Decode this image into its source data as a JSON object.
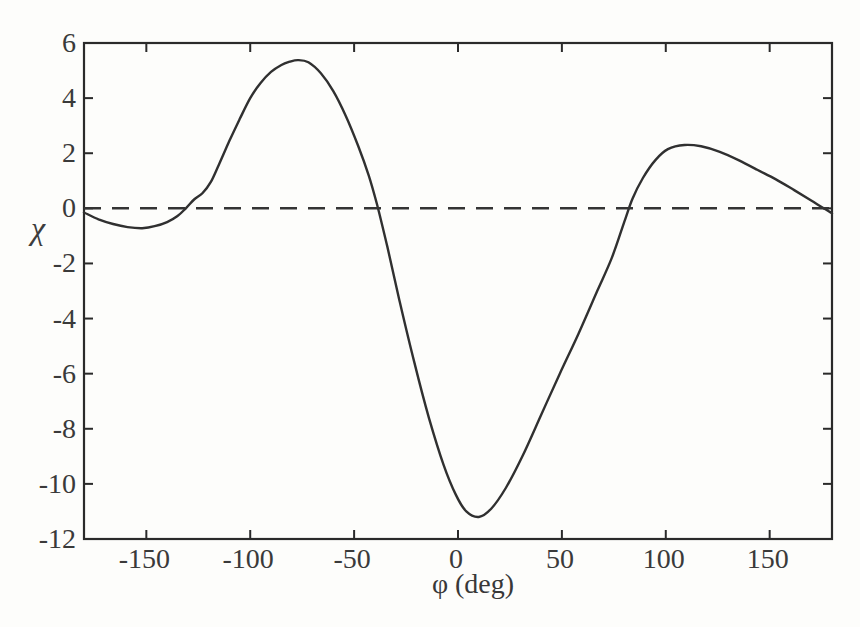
{
  "figure": {
    "background_color": "#fdfdfb",
    "curve_color": "#303030",
    "dash_color": "#343434",
    "axis_color": "#2a2a2a",
    "text_color": "#3a3a3a"
  },
  "chart_data": {
    "type": "line",
    "title": "",
    "xlabel": "φ (deg)",
    "ylabel": "χ",
    "xlim": [
      -180,
      180
    ],
    "ylim": [
      -12,
      6
    ],
    "x_ticks": [
      -150,
      -100,
      -50,
      0,
      50,
      100,
      150
    ],
    "x_tick_labels": [
      "-150",
      "-100",
      "-50",
      "0",
      "50",
      "100",
      "150"
    ],
    "y_ticks": [
      6,
      4,
      2,
      0,
      -2,
      -4,
      -6,
      -8,
      -10,
      -12
    ],
    "y_tick_labels": [
      "6",
      "4",
      "2",
      "0",
      "-2",
      "-4",
      "-6",
      "-8",
      "-10",
      "-12"
    ],
    "grid": false,
    "legend": null,
    "series": [
      {
        "name": "chi-vs-phi",
        "style": "solid",
        "points": [
          [
            -180,
            -0.15
          ],
          [
            -173,
            -0.4
          ],
          [
            -166,
            -0.57
          ],
          [
            -159,
            -0.68
          ],
          [
            -152,
            -0.72
          ],
          [
            -146,
            -0.65
          ],
          [
            -140,
            -0.5
          ],
          [
            -135,
            -0.28
          ],
          [
            -131,
            0.0
          ],
          [
            -127,
            0.32
          ],
          [
            -123,
            0.55
          ],
          [
            -119,
            0.95
          ],
          [
            -115,
            1.6
          ],
          [
            -110,
            2.45
          ],
          [
            -105,
            3.25
          ],
          [
            -100,
            4.0
          ],
          [
            -95,
            4.55
          ],
          [
            -90,
            4.95
          ],
          [
            -85,
            5.2
          ],
          [
            -81,
            5.32
          ],
          [
            -77,
            5.38
          ],
          [
            -72,
            5.3
          ],
          [
            -66,
            4.9
          ],
          [
            -60,
            4.25
          ],
          [
            -54,
            3.35
          ],
          [
            -48,
            2.25
          ],
          [
            -43,
            1.2
          ],
          [
            -39,
            0.15
          ],
          [
            -34,
            -1.4
          ],
          [
            -28,
            -3.4
          ],
          [
            -21,
            -5.6
          ],
          [
            -14,
            -7.6
          ],
          [
            -7,
            -9.3
          ],
          [
            -1,
            -10.4
          ],
          [
            4,
            -11.0
          ],
          [
            10,
            -11.2
          ],
          [
            16,
            -10.9
          ],
          [
            23,
            -10.15
          ],
          [
            31,
            -9.0
          ],
          [
            40,
            -7.5
          ],
          [
            49,
            -6.0
          ],
          [
            58,
            -4.55
          ],
          [
            67,
            -3.0
          ],
          [
            74,
            -1.8
          ],
          [
            80,
            -0.5
          ],
          [
            84,
            0.35
          ],
          [
            89,
            1.1
          ],
          [
            95,
            1.75
          ],
          [
            101,
            2.15
          ],
          [
            109,
            2.3
          ],
          [
            117,
            2.25
          ],
          [
            126,
            2.05
          ],
          [
            135,
            1.75
          ],
          [
            144,
            1.4
          ],
          [
            153,
            1.05
          ],
          [
            162,
            0.65
          ],
          [
            170,
            0.28
          ],
          [
            176,
            0.0
          ],
          [
            180,
            -0.18
          ]
        ]
      },
      {
        "name": "zero-reference",
        "style": "dashed",
        "points": [
          [
            -180,
            0
          ],
          [
            180,
            0
          ]
        ]
      }
    ]
  }
}
